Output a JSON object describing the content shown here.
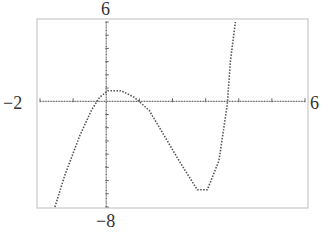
{
  "window_labels": {
    "ymax": "6",
    "ymin": "−8",
    "xmin": "−2",
    "xmax": "6"
  },
  "colors": {
    "frame": "#c8c8c8",
    "axis": "#666666",
    "curve": "#555555"
  },
  "chart_data": {
    "type": "line",
    "title": "",
    "xlabel": "",
    "ylabel": "",
    "xlim": [
      -2,
      6
    ],
    "ylim": [
      -8,
      6
    ],
    "grid": false,
    "legend": null,
    "tick_spacing": {
      "x": 1,
      "y": 1
    },
    "series": [
      {
        "name": "f(x)",
        "style": "dotted",
        "x": [
          -1.55,
          -1.25,
          -0.8,
          -0.45,
          -0.2,
          0.05,
          0.45,
          0.85,
          1.3,
          1.75,
          2.2,
          2.75,
          3.05,
          3.4,
          3.65,
          3.75,
          3.9
        ],
        "y": [
          -8.0,
          -5.6,
          -2.6,
          -0.7,
          0.3,
          0.8,
          0.8,
          0.3,
          -0.7,
          -2.6,
          -4.5,
          -6.7,
          -6.7,
          -4.5,
          -0.3,
          3.1,
          6.0
        ]
      }
    ],
    "features": {
      "local_max": {
        "x": 0.2,
        "y": 0.8
      },
      "local_min": {
        "x": 2.9,
        "y": -6.7
      },
      "x_intercepts": [
        -0.7,
        1.3,
        3.6
      ]
    }
  }
}
